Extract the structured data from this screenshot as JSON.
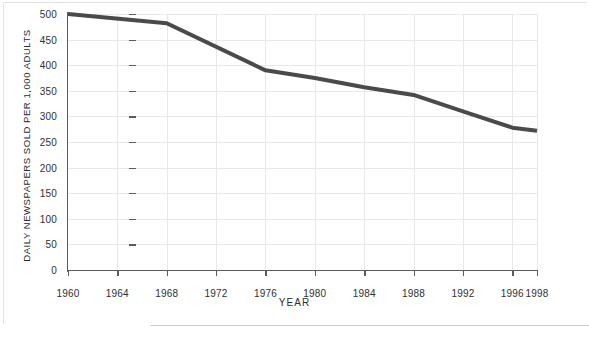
{
  "chart_data": {
    "type": "line",
    "title": "",
    "xlabel": "YEAR",
    "ylabel": "DAILY NEWSPAPERS SOLD PER 1,000 ADULTS",
    "x": [
      1960,
      1968,
      1976,
      1980,
      1984,
      1988,
      1992,
      1996,
      1998
    ],
    "values": [
      500,
      482,
      390,
      375,
      357,
      342,
      310,
      278,
      272
    ],
    "series": [
      {
        "name": "Daily newspapers sold per 1,000 adults",
        "x": [
          1960,
          1968,
          1976,
          1980,
          1984,
          1988,
          1992,
          1996,
          1998
        ],
        "values": [
          500,
          482,
          390,
          375,
          357,
          342,
          310,
          278,
          272
        ]
      }
    ],
    "xlim": [
      1960,
      1998
    ],
    "ylim": [
      0,
      500
    ],
    "x_ticks": [
      1960,
      1964,
      1968,
      1972,
      1976,
      1980,
      1984,
      1988,
      1992,
      1996,
      1998
    ],
    "x_tick_labels": [
      "1960",
      "1964",
      "1968",
      "1972",
      "1976",
      "1980",
      "1984",
      "1988",
      "1992",
      "1996",
      "1998"
    ],
    "y_ticks": [
      0,
      50,
      100,
      150,
      200,
      250,
      300,
      350,
      400,
      450,
      500
    ],
    "y_tick_labels": [
      "0",
      "50",
      "100",
      "150",
      "200",
      "250",
      "300",
      "350",
      "400",
      "450",
      "500"
    ],
    "grid": true,
    "legend": null,
    "legend_position": "none",
    "line_color": "#4a4a4a",
    "grid_color": "#e8e8e8",
    "axis_color": "#5b5b5b",
    "text_color": "#2b2b2b",
    "background_color": "#ffffff",
    "line_width": 4
  }
}
